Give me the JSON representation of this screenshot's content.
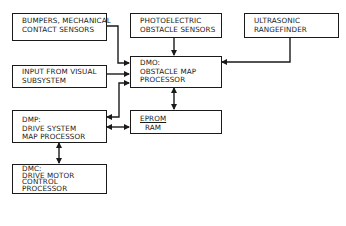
{
  "diagram": {
    "nodes": [
      {
        "id": "bumpers",
        "lines": [
          "BUMPERS, MECHANICAL",
          "CONTACT SENSORS"
        ]
      },
      {
        "id": "photoelectric",
        "lines": [
          "PHOTOELECTRIC",
          "OBSTACLE SENSORS"
        ]
      },
      {
        "id": "ultrasonic",
        "lines": [
          "ULTRASONIC",
          "RANGEFINDER"
        ]
      },
      {
        "id": "visual",
        "lines": [
          "INPUT FROM VISUAL",
          "SUBSYSTEM"
        ]
      },
      {
        "id": "dmo",
        "lines": [
          "DMO:",
          "OBSTACLE MAP",
          "PROCESSOR"
        ]
      },
      {
        "id": "dmp",
        "lines": [
          "DMP:",
          "DRIVE SYSTEM",
          "MAP PROCESSOR"
        ]
      },
      {
        "id": "memory",
        "lines": [
          "EPROM",
          "RAM"
        ]
      },
      {
        "id": "dmc",
        "lines": [
          "DMC:",
          "DRIVE MOTOR",
          "CONTROL",
          "PROCESSOR"
        ]
      }
    ],
    "edges": [
      {
        "from": "bumpers",
        "to": "dmo",
        "direction": "one-way"
      },
      {
        "from": "photoelectric",
        "to": "dmo",
        "direction": "one-way"
      },
      {
        "from": "ultrasonic",
        "to": "dmo",
        "direction": "one-way"
      },
      {
        "from": "visual",
        "to": "dmo",
        "direction": "one-way"
      },
      {
        "from": "dmo",
        "to": "memory",
        "direction": "two-way"
      },
      {
        "from": "dmo",
        "to": "dmp",
        "direction": "two-way"
      },
      {
        "from": "dmp",
        "to": "memory",
        "direction": "two-way"
      },
      {
        "from": "dmp",
        "to": "dmc",
        "direction": "two-way"
      }
    ]
  }
}
